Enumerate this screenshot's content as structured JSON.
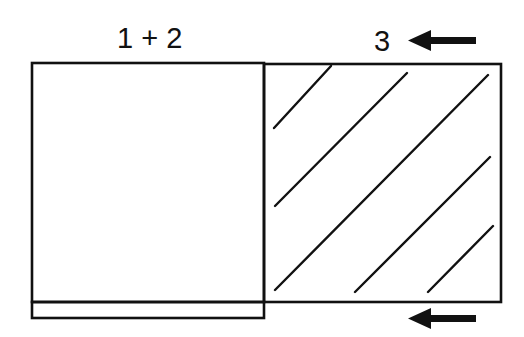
{
  "labels": {
    "left_region": "1 + 2",
    "right_region": "3"
  },
  "arrows": [
    {
      "position": "top",
      "direction": "left"
    },
    {
      "position": "bottom",
      "direction": "left"
    }
  ],
  "regions": [
    {
      "name": "left-box",
      "fill": "none",
      "stroke": "#111111"
    },
    {
      "name": "right-box",
      "fill": "diagonal-hatch",
      "stroke": "#111111"
    },
    {
      "name": "bottom-strip",
      "fill": "none",
      "stroke": "#111111"
    }
  ],
  "colors": {
    "stroke": "#111111",
    "background": "#ffffff"
  }
}
